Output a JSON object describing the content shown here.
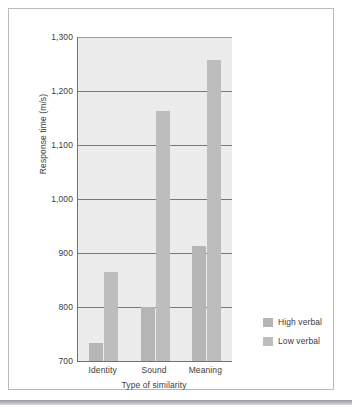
{
  "chart_data": {
    "type": "bar",
    "title": "",
    "xlabel": "Type of similarity",
    "ylabel": "Response time (m/s)",
    "categories": [
      "Identity",
      "Sound",
      "Meaning"
    ],
    "series": [
      {
        "name": "High verbal",
        "values": [
          733,
          800,
          913
        ],
        "color": "#b5b5b6"
      },
      {
        "name": "Low verbal",
        "values": [
          865,
          1163,
          1258
        ],
        "color": "#bdbdbe"
      }
    ],
    "ylim": [
      700,
      1300
    ],
    "yticks": [
      700,
      800,
      900,
      1000,
      1100,
      1200,
      1300
    ],
    "ytick_labels": [
      "700",
      "800",
      "900",
      "1,000",
      "1,100",
      "1,200",
      "1,300"
    ],
    "grid": true,
    "legend_position": "right",
    "plot_background": "#ececed",
    "axis_color": "#6f6f74",
    "grid_color": "#76767b"
  },
  "legend": {
    "items": [
      {
        "label": "High verbal"
      },
      {
        "label": "Low verbal"
      }
    ]
  }
}
